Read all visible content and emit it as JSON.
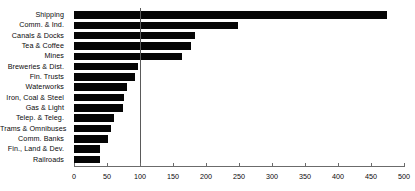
{
  "chart_data": {
    "type": "bar",
    "orientation": "horizontal",
    "title": "",
    "xlabel": "",
    "ylabel": "",
    "xlim": [
      0,
      500
    ],
    "ylim": null,
    "grid": false,
    "legend": null,
    "bar_color": "#050505",
    "reference_line": {
      "value": 100,
      "color": "#5a5a5a",
      "orientation": "vertical"
    },
    "xticks": [
      0,
      50,
      100,
      150,
      200,
      250,
      300,
      350,
      400,
      450,
      500
    ],
    "xticklabels": [
      "0",
      "50",
      "100",
      "150",
      "200",
      "250",
      "300",
      "350",
      "400",
      "450",
      "500"
    ],
    "categories": [
      "Shipping",
      "Comm. & Ind.",
      "Canals & Docks",
      "Tea & Coffee",
      "Mines",
      "Breweries & Dist.",
      "Fin. Trusts",
      "Waterworks",
      "Iron, Coal & Steel",
      "Gas & Light",
      "Telep. & Teleg.",
      "Trams & Omnibuses",
      "Comm. Banks",
      "Fin., Land & Dev.",
      "Railroads"
    ],
    "values": [
      474,
      249,
      184,
      178,
      163,
      97,
      92,
      81,
      75,
      74,
      60,
      56,
      52,
      40,
      39
    ]
  }
}
